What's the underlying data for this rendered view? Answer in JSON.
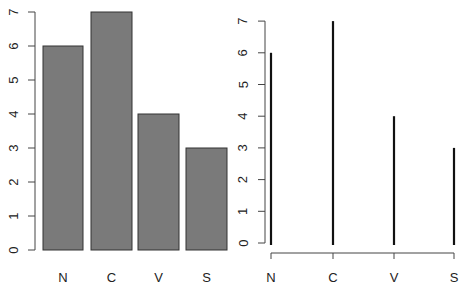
{
  "chart_data": [
    {
      "type": "bar",
      "title": "",
      "xlabel": "",
      "ylabel": "",
      "categories": [
        "N",
        "C",
        "V",
        "S"
      ],
      "values": [
        6,
        7,
        4,
        3
      ],
      "ylim": [
        0,
        7
      ],
      "yticks": [
        0,
        1,
        2,
        3,
        4,
        5,
        6,
        7
      ],
      "grid": false,
      "legend": null,
      "bar_color": "#7a7a7a",
      "border_color": "#333333"
    },
    {
      "type": "line",
      "subtype": "vertical-lines (type='h')",
      "title": "",
      "xlabel": "",
      "ylabel": "",
      "categories": [
        "N",
        "C",
        "V",
        "S"
      ],
      "values": [
        6,
        7,
        4,
        3
      ],
      "ylim": [
        0,
        7
      ],
      "yticks": [
        0,
        1,
        2,
        3,
        4,
        5,
        6,
        7
      ],
      "grid": false,
      "legend": null,
      "line_color": "#111111"
    }
  ],
  "left_plot": {
    "axis": {
      "x": 35,
      "y0": 250,
      "unit": 34,
      "tick_len": 7
    },
    "bars": [
      {
        "label": "N",
        "value": 6,
        "x": 43,
        "w": 40
      },
      {
        "label": "C",
        "value": 7,
        "x": 91,
        "w": 41
      },
      {
        "label": "V",
        "value": 4,
        "x": 138,
        "w": 41
      },
      {
        "label": "S",
        "value": 3,
        "x": 186,
        "w": 41
      }
    ],
    "label_y": 282
  },
  "right_plot": {
    "axis": {
      "x": 265,
      "y0": 243,
      "unit": 31.7,
      "tick_len": 7
    },
    "xaxis": {
      "y": 253,
      "x1": 271,
      "x2": 454,
      "tick_len": 6
    },
    "lines": [
      {
        "label": "N",
        "value": 6,
        "x": 271
      },
      {
        "label": "C",
        "value": 7,
        "x": 333
      },
      {
        "label": "V",
        "value": 4,
        "x": 394
      },
      {
        "label": "S",
        "value": 3,
        "x": 454
      }
    ],
    "label_y": 282
  }
}
